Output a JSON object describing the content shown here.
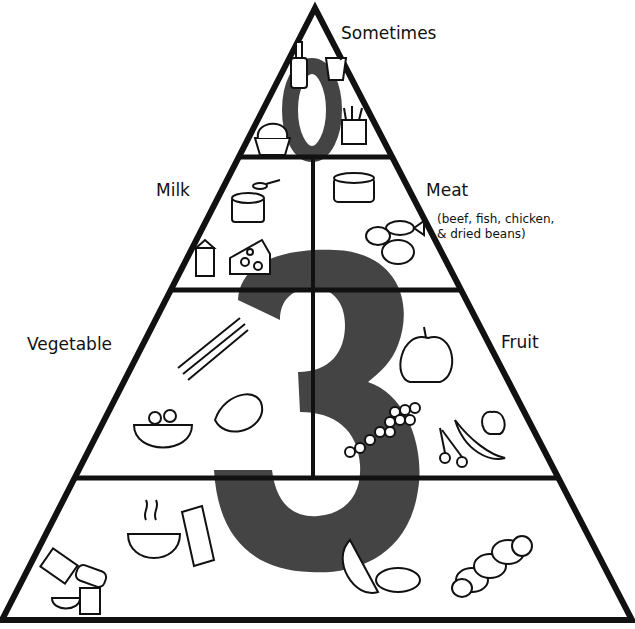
{
  "diagram": {
    "type": "food-pyramid",
    "colors": {
      "outline": "#111111",
      "numeral": "#444444",
      "background": "#ffffff"
    },
    "tiers": [
      {
        "id": "top",
        "label": "Sometimes",
        "numeral": "0",
        "foods": [
          "soda-bottle",
          "drink-cup",
          "ice-cream",
          "french-fries"
        ],
        "food_text": [
          "ICE CREAM"
        ]
      },
      {
        "id": "second",
        "sections": [
          {
            "label": "Milk",
            "foods": [
              "yogurt",
              "spoon",
              "milk-carton",
              "cheese"
            ],
            "food_text": [
              "Yogurt"
            ]
          },
          {
            "label": "Meat",
            "sublabel_lines": [
              "(beef, fish, chicken,",
              "& dried beans)"
            ],
            "foods": [
              "tuna-can",
              "fish",
              "chicken",
              "beans"
            ],
            "food_text": [
              "TUNA"
            ]
          }
        ]
      },
      {
        "id": "third",
        "numeral": "3",
        "sections": [
          {
            "label": "Vegetable",
            "foods": [
              "asparagus",
              "salad-bowl",
              "lettuce"
            ]
          },
          {
            "label": "Fruit",
            "foods": [
              "apple",
              "grapes",
              "banana",
              "cherries",
              "small-apple"
            ]
          }
        ]
      },
      {
        "id": "bottom",
        "foods": [
          "crackers",
          "bread-loaf",
          "cereal-bowl",
          "cereal-box",
          "oatmeal-bowl",
          "milk-carton",
          "melon",
          "tortilla",
          "braided-bread"
        ],
        "food_text": [
          "MILK",
          "Cereal"
        ]
      }
    ]
  }
}
